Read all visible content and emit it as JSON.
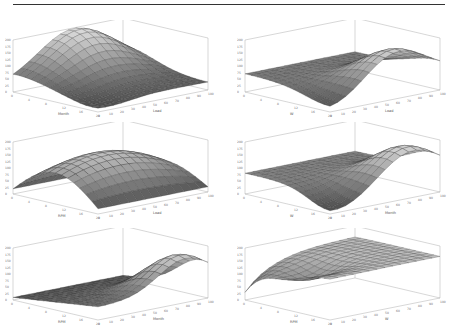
{
  "figure": {
    "panels": [
      {
        "id": "a",
        "ylabel": "MPa",
        "xlabel_left": "Month",
        "xlabel_right": "Load"
      },
      {
        "id": "b",
        "ylabel": "MPa",
        "xlabel_left": "W",
        "xlabel_right": "Load"
      },
      {
        "id": "c",
        "ylabel": "MPa",
        "xlabel_left": "RPM",
        "xlabel_right": "Load"
      },
      {
        "id": "d",
        "ylabel": "MPa",
        "xlabel_left": "W",
        "xlabel_right": "Month"
      },
      {
        "id": "e",
        "ylabel": "MPa",
        "xlabel_left": "RPM",
        "xlabel_right": "Month"
      },
      {
        "id": "f",
        "ylabel": "MPa",
        "xlabel_left": "RPM",
        "xlabel_right": "W"
      }
    ]
  },
  "chart_data": [
    {
      "type": "surface",
      "title": "",
      "xlabel": "Month",
      "ylabel": "Load",
      "zlabel": "MPa",
      "shape": "peak at back-left, low at front corner"
    },
    {
      "type": "surface",
      "title": "",
      "xlabel": "W",
      "ylabel": "Load",
      "zlabel": "MPa",
      "shape": "peak at back-center-right, drops to front-right"
    },
    {
      "type": "surface",
      "title": "",
      "xlabel": "RPM",
      "ylabel": "Load",
      "zlabel": "MPa",
      "shape": "dome/plateau, low at left and right edges"
    },
    {
      "type": "surface",
      "title": "",
      "xlabel": "W",
      "ylabel": "Month",
      "zlabel": "MPa",
      "shape": "peak at back-right, low front-right"
    },
    {
      "type": "surface",
      "title": "",
      "xlabel": "RPM",
      "ylabel": "Month",
      "zlabel": "MPa",
      "shape": "flat low left rising to peak at right"
    },
    {
      "type": "surface",
      "title": "",
      "xlabel": "RPM",
      "ylabel": "W",
      "zlabel": "MPa",
      "shape": "plateau with dip in front-center, low left corner"
    }
  ]
}
